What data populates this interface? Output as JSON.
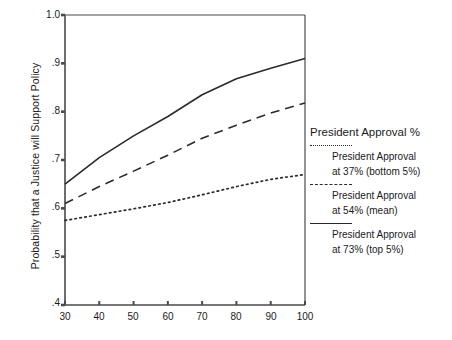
{
  "chart_data": {
    "type": "line",
    "title": "",
    "xlabel": "",
    "ylabel": "Probability that a Justice will Support Policy",
    "xlim": [
      30,
      100
    ],
    "ylim": [
      0.4,
      1.0
    ],
    "xticks": [
      30,
      40,
      50,
      60,
      70,
      80,
      90,
      100
    ],
    "xtick_labels": [
      "30",
      "40",
      "50",
      "60",
      "70",
      "80",
      "90",
      "100"
    ],
    "yticks": [
      0.4,
      0.5,
      0.6,
      0.7,
      0.8,
      0.9,
      1.0
    ],
    "ytick_labels": [
      ".4",
      ".5",
      ".6",
      ".7",
      ".8",
      ".9",
      "1.0"
    ],
    "grid": false,
    "legend_position": "right",
    "x": [
      30,
      40,
      50,
      60,
      70,
      80,
      90,
      100
    ],
    "series": [
      {
        "name": "President Approval at 73% (top 5%)",
        "style": "solid",
        "color": "#2b2b2b",
        "values": [
          0.65,
          0.705,
          0.75,
          0.79,
          0.835,
          0.868,
          0.89,
          0.91
        ]
      },
      {
        "name": "President Approval at 54% (mean)",
        "style": "dashed",
        "color": "#2b2b2b",
        "values": [
          0.61,
          0.645,
          0.677,
          0.71,
          0.745,
          0.772,
          0.797,
          0.818
        ]
      },
      {
        "name": "President Approval at 37% (bottom 5%)",
        "style": "dotted",
        "color": "#2b2b2b",
        "values": [
          0.575,
          0.587,
          0.599,
          0.612,
          0.628,
          0.645,
          0.66,
          0.67
        ]
      }
    ]
  },
  "legend": {
    "title": "President Approval %",
    "entries": [
      {
        "style": "dotted",
        "line1": "President Approval",
        "line2": "at 37% (bottom 5%)"
      },
      {
        "style": "dashed",
        "line1": "President Approval",
        "line2": "at 54% (mean)"
      },
      {
        "style": "solid",
        "line1": "President Approval",
        "line2": "at 73% (top 5%)"
      }
    ]
  },
  "axes": {
    "y_title": "Probability that a Justice will Support Policy",
    "y_labels": [
      "1.0",
      ".9",
      ".8",
      ".7",
      ".6",
      ".5",
      ".4"
    ],
    "x_labels": [
      "30",
      "40",
      "50",
      "60",
      "70",
      "80",
      "90",
      "100"
    ]
  },
  "colors": {
    "line": "#2b2b2b",
    "axis": "#4a4a4a",
    "text": "#1a1a1a",
    "background": "#ffffff"
  }
}
